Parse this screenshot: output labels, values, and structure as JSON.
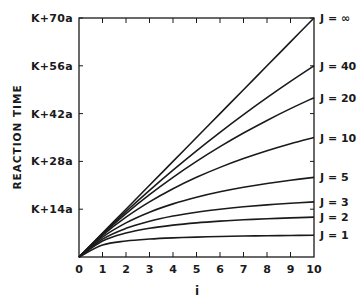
{
  "chart_data": {
    "type": "line",
    "title": "",
    "xlabel": "i",
    "ylabel": "REACTION TIME",
    "x": [
      0,
      1,
      2,
      3,
      4,
      5,
      6,
      7,
      8,
      9,
      10
    ],
    "xticks": [
      "0",
      "1",
      "2",
      "3",
      "4",
      "5",
      "6",
      "7",
      "8",
      "9",
      "10"
    ],
    "xlim": [
      0,
      10
    ],
    "ylim": [
      0,
      70
    ],
    "yticks": [
      {
        "value": 14,
        "label": "K+14a"
      },
      {
        "value": 28,
        "label": "K+28a"
      },
      {
        "value": 42,
        "label": "K+42a"
      },
      {
        "value": 56,
        "label": "K+56a"
      },
      {
        "value": 70,
        "label": "K+70a"
      }
    ],
    "y_units": "a (offset K)",
    "grid": false,
    "legend_position": "right-end labels",
    "series": [
      {
        "name": "J=∞",
        "values": [
          0,
          7,
          14,
          21,
          28,
          35,
          42,
          49,
          56,
          63,
          70
        ]
      },
      {
        "name": "J=40",
        "values": [
          0,
          6.83,
          13.33,
          19.53,
          25.45,
          31.11,
          36.52,
          41.7,
          46.67,
          51.43,
          56
        ]
      },
      {
        "name": "J=20",
        "values": [
          0,
          6.67,
          12.73,
          18.26,
          23.33,
          28,
          32.31,
          36.3,
          40,
          43.45,
          46.67
        ]
      },
      {
        "name": "J=10",
        "values": [
          0,
          6.36,
          11.67,
          16.15,
          20,
          23.33,
          26.25,
          28.82,
          31.11,
          33.16,
          35
        ]
      },
      {
        "name": "J=5",
        "values": [
          0,
          5.83,
          10,
          13.13,
          15.56,
          17.5,
          19.09,
          20.42,
          21.54,
          22.5,
          23.33
        ]
      },
      {
        "name": "J=3",
        "values": [
          0,
          5.25,
          8.4,
          10.5,
          12,
          13.13,
          14,
          14.7,
          15.27,
          15.75,
          16.15
        ]
      },
      {
        "name": "J=2",
        "values": [
          0,
          4.67,
          7,
          8.4,
          9.33,
          10,
          10.5,
          10.89,
          11.2,
          11.45,
          11.67
        ]
      },
      {
        "name": "J=1",
        "values": [
          0,
          3.5,
          4.67,
          5.25,
          5.6,
          5.83,
          6,
          6.13,
          6.22,
          6.3,
          6.36
        ]
      }
    ],
    "line_color": "#1a1a1a"
  }
}
